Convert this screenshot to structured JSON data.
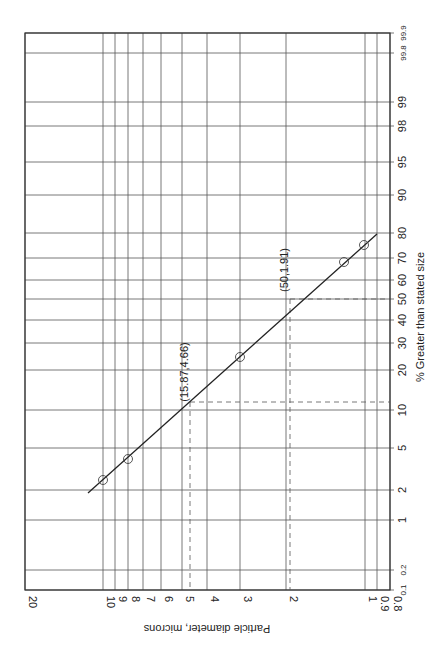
{
  "chart_data": {
    "type": "scatter",
    "title": "",
    "orientation": "rotated 90deg counter-clockwise (log-probability paper)",
    "xlabel": "% Greater than stated size",
    "ylabel": "Particle diameter, microns",
    "x_scale": "probability",
    "y_scale": "log",
    "xlim": [
      0.1,
      99.9
    ],
    "ylim": [
      0.8,
      20
    ],
    "x_ticks": [
      "0.1",
      "0.2",
      "1",
      "2",
      "5",
      "10",
      "20",
      "30",
      "40",
      "50",
      "60",
      "70",
      "80",
      "90",
      "95",
      "98",
      "99",
      "99.8",
      "99.9"
    ],
    "y_ticks": [
      "0.8",
      "0.9",
      "1",
      "2",
      "3",
      "4",
      "5",
      "6",
      "7",
      "8",
      "9",
      "10",
      "20"
    ],
    "grid": true,
    "series": [
      {
        "name": "measured data",
        "marker": "open circle",
        "points": [
          {
            "x": 3.5,
            "y": 10.0
          },
          {
            "x": 5.5,
            "y": 8.2
          },
          {
            "x": 30,
            "y": 3.0
          },
          {
            "x": 70,
            "y": 1.3
          },
          {
            "x": 76,
            "y": 1.1
          }
        ]
      },
      {
        "name": "best-fit line",
        "style": "solid line",
        "points": [
          {
            "x": 2.2,
            "y": 11.5
          },
          {
            "x": 15.87,
            "y": 4.66
          },
          {
            "x": 50,
            "y": 1.91
          },
          {
            "x": 80,
            "y": 1.0
          }
        ]
      }
    ],
    "annotations": [
      {
        "text": "(15.87,4.66)",
        "x": 15.87,
        "y": 4.66,
        "style": "dashed guide lines"
      },
      {
        "text": "(50,1.91)",
        "x": 50,
        "y": 1.91,
        "style": "dashed guide lines"
      }
    ]
  },
  "labels": {
    "xlabel": "% Greater than stated size",
    "ylabel": "Particle diameter, microns",
    "ann1": "(15.87,4.66)",
    "ann2": "(50,1.91)"
  },
  "diameter_ticks": [
    {
      "label": "20",
      "px": 25
    },
    {
      "label": "10",
      "px": 103
    },
    {
      "label": "9",
      "px": 115
    },
    {
      "label": "8",
      "px": 128
    },
    {
      "label": "7",
      "px": 143
    },
    {
      "label": "6",
      "px": 161
    },
    {
      "label": "5",
      "px": 182
    },
    {
      "label": "4",
      "px": 207
    },
    {
      "label": "3",
      "px": 240
    },
    {
      "label": "2",
      "px": 286
    },
    {
      "label": "1",
      "px": 365
    },
    {
      "label": "0.9",
      "px": 377
    },
    {
      "label": "0.8",
      "px": 390
    }
  ],
  "percent_ticks": [
    {
      "label": "99.9",
      "py": 33,
      "small": true
    },
    {
      "label": "99.8",
      "py": 53,
      "small": true
    },
    {
      "label": "99",
      "py": 102
    },
    {
      "label": "98",
      "py": 126
    },
    {
      "label": "95",
      "py": 162
    },
    {
      "label": "90",
      "py": 195
    },
    {
      "label": "80",
      "py": 233
    },
    {
      "label": "70",
      "py": 258
    },
    {
      "label": "60",
      "py": 280
    },
    {
      "label": "50",
      "py": 299
    },
    {
      "label": "40",
      "py": 320
    },
    {
      "label": "30",
      "py": 343
    },
    {
      "label": "20",
      "py": 370
    },
    {
      "label": "10",
      "py": 410
    },
    {
      "label": "5",
      "py": 448
    },
    {
      "label": "2",
      "py": 490
    },
    {
      "label": "1",
      "py": 520
    },
    {
      "label": "0.2",
      "py": 570,
      "small": true
    },
    {
      "label": "0.1",
      "py": 590,
      "small": true
    }
  ],
  "points_px": [
    {
      "cx": 103,
      "cy": 480
    },
    {
      "cx": 128,
      "cy": 459
    },
    {
      "cx": 240,
      "cy": 357
    },
    {
      "cx": 344,
      "cy": 262
    },
    {
      "cx": 364,
      "cy": 245
    }
  ],
  "fit_line_px": {
    "x1": 88,
    "y1": 493,
    "x2": 377,
    "y2": 234
  },
  "guides_px": {
    "g1": {
      "x": 190,
      "y": 402
    },
    "g2": {
      "x": 290,
      "y": 299
    }
  }
}
